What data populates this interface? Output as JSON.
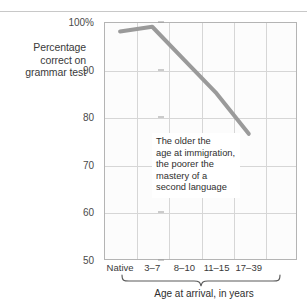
{
  "chart_data": {
    "type": "line",
    "title": "",
    "ylabel": "Percentage correct on grammar test",
    "ylabel_lines": [
      "Percentage",
      "correct on",
      "grammar test"
    ],
    "xlabel": "Age at arrival, in years",
    "categories": [
      "Native",
      "3–7",
      "8–10",
      "11–15",
      "17–39"
    ],
    "values": [
      98,
      99,
      92,
      85,
      76.5
    ],
    "series": [
      {
        "name": "Percentage correct on grammar test",
        "values": [
          98,
          99,
          92,
          85,
          76.5
        ],
        "color": "#9a9a9a"
      }
    ],
    "ylim": [
      50,
      100
    ],
    "yticks": [
      100,
      90,
      80,
      70,
      60,
      50
    ],
    "ytick_labels": [
      "100%",
      "90",
      "80",
      "70",
      "60",
      "50"
    ],
    "grid": true,
    "legend": "none",
    "annotations": [
      {
        "lines": [
          "The older the",
          "age at immigration,",
          "the poorer the",
          "mastery of a",
          "second language"
        ]
      }
    ],
    "xlabel_brace_spans": [
      "3–7",
      "17–39"
    ]
  },
  "colors": {
    "line": "#9a9a9a",
    "grid": "#d6d6d6",
    "axis": "#b4b4b4",
    "text": "#3a3a3a",
    "plot_background": "#fcfcfc",
    "page_background": "#ffffff"
  }
}
